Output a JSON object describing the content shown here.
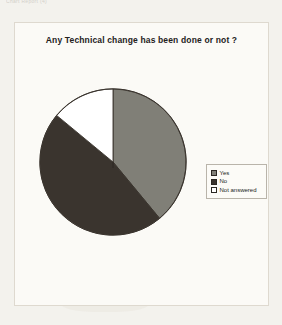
{
  "scan": {
    "header_text": "Chart Report (4)"
  },
  "chart": {
    "title": "Any Technical change has been done or not ?"
  },
  "legend": {
    "items": [
      {
        "label": "Yes",
        "swatch_name": "legend-swatch-yes",
        "color": "#807f77"
      },
      {
        "label": "No",
        "swatch_name": "legend-swatch-no",
        "color": "#3a342e"
      },
      {
        "label": "Not answered",
        "swatch_name": "legend-swatch-not-answered",
        "color": "#ffffff"
      }
    ]
  },
  "chart_data": {
    "type": "pie",
    "title": "Any Technical change has been done or not ?",
    "categories": [
      "Yes",
      "No",
      "Not answered"
    ],
    "values": [
      39,
      47,
      14
    ],
    "unit": "percent",
    "colors": [
      "#807f77",
      "#3a342e",
      "#ffffff"
    ],
    "start_angle_deg": 0,
    "direction": "clockwise",
    "slice_angles_deg": [
      140,
      170,
      50
    ],
    "legend_position": "right",
    "grid": false,
    "xlabel": "",
    "ylabel": ""
  }
}
